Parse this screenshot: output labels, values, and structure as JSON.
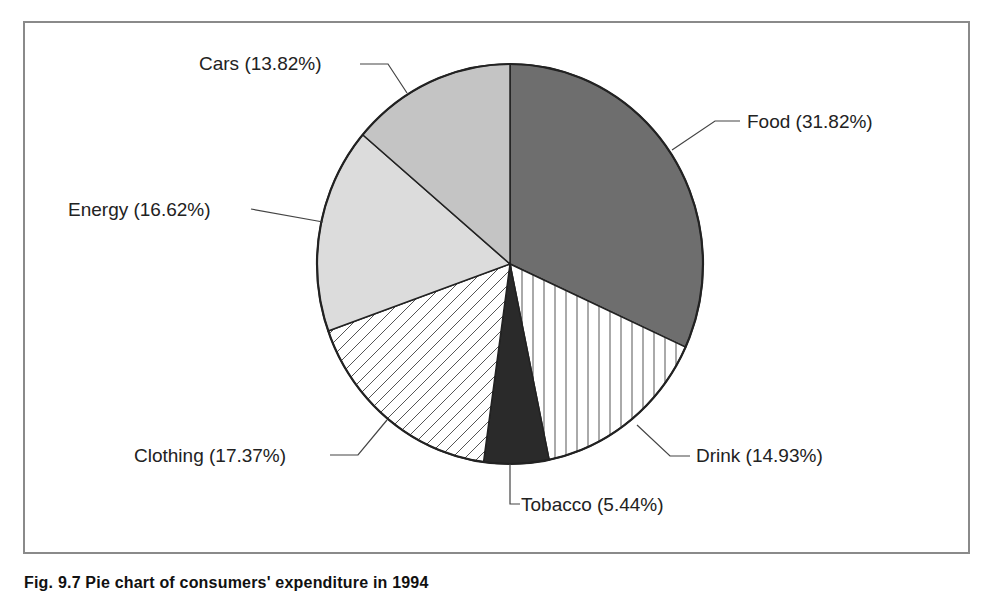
{
  "chart_data": {
    "type": "pie",
    "title": "",
    "caption": "Fig. 9.7 Pie chart of consumers' expenditure in 1994",
    "start_angle": "12 o'clock, clockwise",
    "slices": [
      {
        "label": "Food",
        "value": 31.82,
        "text": "Food (31.82%)",
        "fill": "dark-grey"
      },
      {
        "label": "Drink",
        "value": 14.93,
        "text": "Drink (14.93%)",
        "fill": "vertical-hatch"
      },
      {
        "label": "Tobacco",
        "value": 5.44,
        "text": "Tobacco (5.44%)",
        "fill": "black"
      },
      {
        "label": "Clothing",
        "value": 17.37,
        "text": "Clothing (17.37%)",
        "fill": "diagonal-hatch"
      },
      {
        "label": "Energy",
        "value": 16.62,
        "text": "Energy (16.62%)",
        "fill": "light-grey"
      },
      {
        "label": "Cars",
        "value": 13.82,
        "text": "Cars (13.82%)",
        "fill": "mid-light-grey"
      }
    ],
    "legend": "none (callout labels)",
    "colors": {
      "food": "#6e6e6e",
      "drink": "#ffffff",
      "tobacco": "#2a2a2a",
      "clothing": "#ffffff",
      "energy": "#dcdcdc",
      "cars": "#c4c4c4",
      "outline": "#222222",
      "frame": "#8a8a8a"
    }
  },
  "labels": {
    "food": "Food (31.82%)",
    "drink": "Drink (14.93%)",
    "tobacco": "Tobacco (5.44%)",
    "clothing": "Clothing (17.37%)",
    "energy": "Energy (16.62%)",
    "cars": "Cars (13.82%)"
  },
  "caption": "Fig. 9.7 Pie chart of consumers' expenditure in 1994"
}
